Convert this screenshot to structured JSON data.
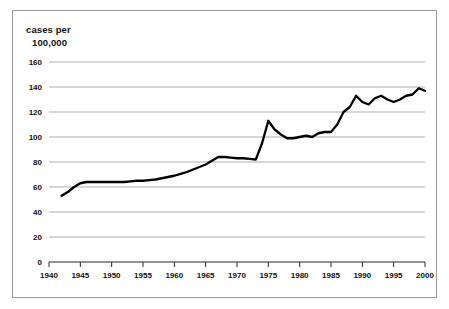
{
  "figure": {
    "axis_title_line1": "cases per",
    "axis_title_line2": "100,000"
  },
  "chart_data": {
    "type": "line",
    "title": "",
    "subtitle": "",
    "xlabel": "",
    "ylabel": "cases per 100,000",
    "xlim": [
      1940,
      2000
    ],
    "ylim": [
      0,
      160
    ],
    "grid": true,
    "legend": false,
    "y_ticks": [
      0,
      20,
      40,
      60,
      80,
      100,
      120,
      140,
      160
    ],
    "x_ticks": [
      1940,
      1945,
      1950,
      1955,
      1960,
      1965,
      1970,
      1975,
      1980,
      1985,
      1990,
      1995,
      2000
    ],
    "line_color": "#000000",
    "grid_color": "#8d8d8d",
    "series": [
      {
        "name": "cases per 100,000",
        "x": [
          1942,
          1943,
          1944,
          1945,
          1946,
          1947,
          1948,
          1949,
          1950,
          1951,
          1952,
          1953,
          1954,
          1955,
          1956,
          1957,
          1958,
          1959,
          1960,
          1961,
          1962,
          1963,
          1964,
          1965,
          1966,
          1967,
          1968,
          1969,
          1970,
          1971,
          1972,
          1973,
          1974,
          1975,
          1976,
          1977,
          1978,
          1979,
          1980,
          1981,
          1982,
          1983,
          1984,
          1985,
          1986,
          1987,
          1988,
          1989,
          1990,
          1991,
          1992,
          1993,
          1994,
          1995,
          1996,
          1997,
          1998,
          1999,
          2000
        ],
        "values": [
          53,
          56,
          60,
          63,
          64,
          64,
          64,
          64,
          64,
          64,
          64,
          64.5,
          65,
          65,
          65.5,
          66,
          67,
          68,
          69,
          70.5,
          72,
          74,
          76,
          78,
          81,
          84,
          84,
          83.5,
          83,
          83,
          82.5,
          82,
          95,
          113,
          106,
          102,
          99,
          99,
          100,
          101,
          100,
          103,
          104,
          104,
          110,
          120,
          124,
          133,
          128,
          126,
          131,
          133,
          130,
          128,
          130,
          133,
          134,
          139,
          137
        ]
      }
    ]
  }
}
